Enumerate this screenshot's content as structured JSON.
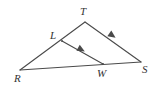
{
  "figure": {
    "kind": "geometry-diagram",
    "canvas": {
      "width": 158,
      "height": 90
    },
    "background_color": "#ffffff",
    "stroke_color": "#4a4a4a",
    "label_color": "#333333",
    "points": [
      {
        "id": "T",
        "label": "T",
        "x": 85,
        "y": 22,
        "label_x": 80,
        "label_y": 6
      },
      {
        "id": "L",
        "label": "L",
        "x": 62,
        "y": 41,
        "label_x": 50,
        "label_y": 30
      },
      {
        "id": "R",
        "label": "R",
        "x": 20,
        "y": 70,
        "label_x": 14,
        "label_y": 73
      },
      {
        "id": "W",
        "label": "W",
        "x": 103,
        "y": 64,
        "label_x": 97,
        "label_y": 68
      },
      {
        "id": "S",
        "label": "S",
        "x": 141,
        "y": 62,
        "label_x": 142,
        "label_y": 64
      }
    ],
    "segments": [
      {
        "id": "RT",
        "from": "R",
        "to": "T",
        "x1": 20,
        "y1": 70,
        "x2": 85,
        "y2": 22
      },
      {
        "id": "TS",
        "from": "T",
        "to": "S",
        "x1": 85,
        "y1": 22,
        "x2": 141,
        "y2": 62
      },
      {
        "id": "RS",
        "from": "R",
        "to": "S",
        "x1": 20,
        "y1": 70,
        "x2": 141,
        "y2": 62
      },
      {
        "id": "LW",
        "from": "L",
        "to": "W",
        "x1": 62,
        "y1": 41,
        "x2": 103,
        "y2": 64
      }
    ],
    "parallel_marks": [
      {
        "id": "mark-TS",
        "on_segment": "TS",
        "ticks": 1,
        "x": 113,
        "y": 36,
        "angle_deg": 35.5
      },
      {
        "id": "mark-LW",
        "on_segment": "LW",
        "ticks": 1,
        "x": 82,
        "y": 50,
        "angle_deg": 29.3
      }
    ]
  }
}
